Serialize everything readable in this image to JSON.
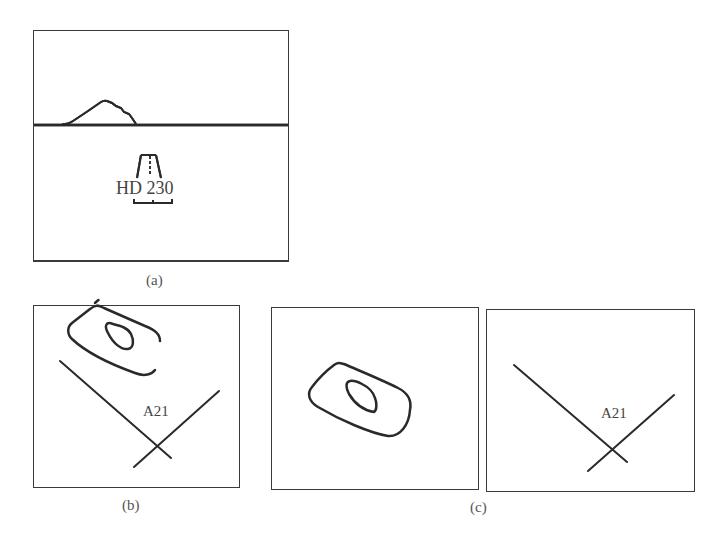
{
  "figure": {
    "panel_a": {
      "caption": "(a)",
      "runway_label": "HD 230"
    },
    "panel_b": {
      "caption": "(b)",
      "waypoint_label": "A21"
    },
    "panel_c": {
      "caption": "(c)",
      "waypoint_label": "A21"
    }
  },
  "colors": {
    "stroke": "#2a2a2a",
    "frame": "#3a3a3a",
    "text": "#444444"
  }
}
